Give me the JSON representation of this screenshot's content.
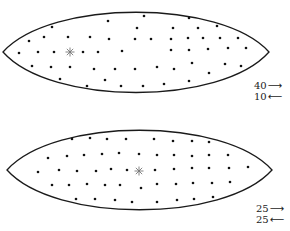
{
  "diagram": {
    "type": "particle-distribution-lens",
    "panels": [
      {
        "id": "top",
        "outline": {
          "cx": 135.5,
          "cy": 52,
          "left": 3,
          "right": 269,
          "top": 5,
          "bottom": 100
        },
        "center_marker": {
          "x": 70,
          "y": 52,
          "symbol": "✳"
        },
        "dots": [
          [
            52,
            27
          ],
          [
            108,
            21
          ],
          [
            144,
            16
          ],
          [
            29,
            41
          ],
          [
            44,
            37
          ],
          [
            68,
            37
          ],
          [
            90,
            37
          ],
          [
            109,
            39
          ],
          [
            137,
            28
          ],
          [
            135,
            39
          ],
          [
            19,
            53
          ],
          [
            38,
            52
          ],
          [
            54,
            52
          ],
          [
            83,
            52
          ],
          [
            98,
            52
          ],
          [
            122,
            51
          ],
          [
            32,
            66
          ],
          [
            51,
            67
          ],
          [
            70,
            67
          ],
          [
            94,
            69
          ],
          [
            115,
            69
          ],
          [
            135,
            69
          ],
          [
            60,
            79
          ],
          [
            105,
            80
          ],
          [
            87,
            86
          ],
          [
            121,
            86
          ],
          [
            143,
            86
          ],
          [
            189,
            18
          ],
          [
            173,
            28
          ],
          [
            198,
            28
          ],
          [
            217,
            26
          ],
          [
            151,
            39
          ],
          [
            171,
            39
          ],
          [
            188,
            38
          ],
          [
            203,
            38
          ],
          [
            220,
            38
          ],
          [
            238,
            38
          ],
          [
            171,
            50
          ],
          [
            189,
            50
          ],
          [
            208,
            49
          ],
          [
            228,
            48
          ],
          [
            246,
            48
          ],
          [
            157,
            67
          ],
          [
            174,
            69
          ],
          [
            192,
            63
          ],
          [
            209,
            73
          ],
          [
            225,
            64
          ],
          [
            241,
            66
          ],
          [
            164,
            84
          ],
          [
            189,
            81
          ]
        ],
        "labels": [
          {
            "text": "40",
            "arrow": "⟶",
            "direction": "right",
            "x": 254,
            "y": 86
          },
          {
            "text": "10",
            "arrow": "⟵",
            "direction": "left",
            "x": 254,
            "y": 97
          }
        ]
      },
      {
        "id": "bottom",
        "outline": {
          "cx": 139.5,
          "cy": 170,
          "left": 7,
          "right": 272,
          "top": 123,
          "bottom": 217
        },
        "center_marker": {
          "x": 139,
          "y": 171,
          "symbol": "✳"
        },
        "dots": [
          [
            72,
            139
          ],
          [
            90,
            138
          ],
          [
            107,
            139
          ],
          [
            126,
            139
          ],
          [
            48,
            158
          ],
          [
            67,
            156
          ],
          [
            84,
            155
          ],
          [
            102,
            154
          ],
          [
            119,
            153
          ],
          [
            139,
            154
          ],
          [
            38,
            172
          ],
          [
            59,
            170
          ],
          [
            77,
            171
          ],
          [
            96,
            171
          ],
          [
            111,
            169
          ],
          [
            127,
            170
          ],
          [
            52,
            185
          ],
          [
            69,
            185
          ],
          [
            87,
            184
          ],
          [
            105,
            185
          ],
          [
            120,
            185
          ],
          [
            141,
            188
          ],
          [
            76,
            199
          ],
          [
            95,
            199
          ],
          [
            115,
            200
          ],
          [
            132,
            202
          ],
          [
            154,
            139
          ],
          [
            173,
            141
          ],
          [
            192,
            141
          ],
          [
            209,
            142
          ],
          [
            157,
            155
          ],
          [
            174,
            155
          ],
          [
            192,
            156
          ],
          [
            209,
            155
          ],
          [
            228,
            155
          ],
          [
            155,
            170
          ],
          [
            174,
            169
          ],
          [
            192,
            168
          ],
          [
            209,
            168
          ],
          [
            229,
            168
          ],
          [
            248,
            167
          ],
          [
            157,
            184
          ],
          [
            176,
            184
          ],
          [
            193,
            183
          ],
          [
            212,
            183
          ],
          [
            230,
            182
          ],
          [
            157,
            202
          ],
          [
            177,
            200
          ],
          [
            194,
            199
          ],
          [
            213,
            197
          ]
        ],
        "labels": [
          {
            "text": "25",
            "arrow": "⟶",
            "direction": "right",
            "x": 256,
            "y": 209
          },
          {
            "text": "25",
            "arrow": "⟵",
            "direction": "left",
            "x": 256,
            "y": 220
          }
        ]
      }
    ],
    "colors": {
      "stroke": "#1a1a1a",
      "dot": "#111111",
      "marker": "#777777",
      "background": "#ffffff"
    }
  }
}
